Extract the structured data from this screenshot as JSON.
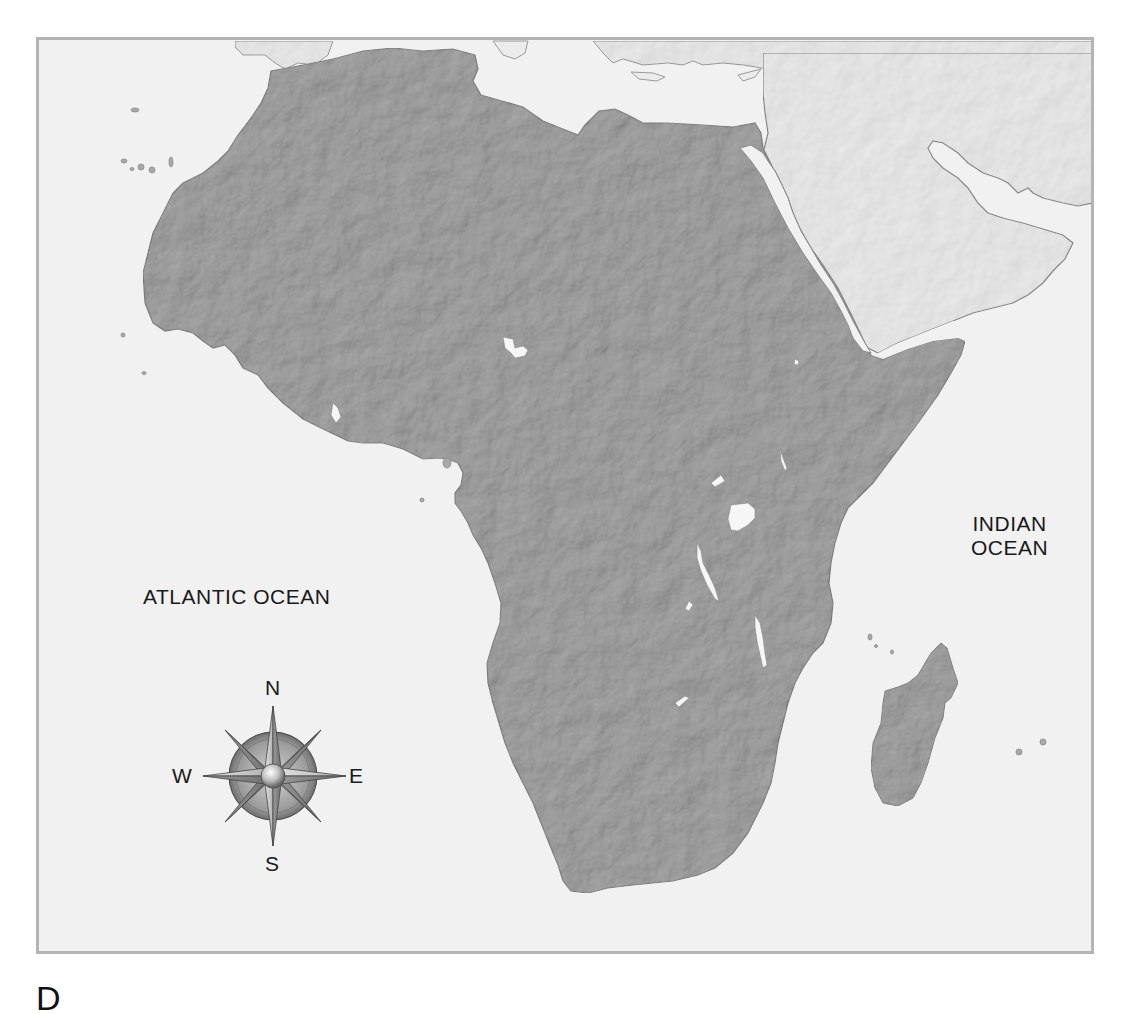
{
  "map": {
    "title": "Physical relief map of Africa",
    "colors": {
      "land_africa": "#a9a9a9",
      "land_other": "#ececec",
      "water": "#f1f1f1",
      "frame_border": "#b4b4b4",
      "lakes": "#f6f6f6",
      "coastline": "#8a8a8a"
    },
    "labels": {
      "atlantic": "ATLANTIC OCEAN",
      "indian_line1": "INDIAN",
      "indian_line2": "OCEAN"
    },
    "features": [
      "Africa",
      "Madagascar",
      "Arabian Peninsula",
      "Mediterranean Sea",
      "Red Sea",
      "Persian Gulf",
      "Lake Chad",
      "Lake Victoria",
      "Lake Tanganyika",
      "Lake Malawi",
      "Canary Islands",
      "Mascarene Islands"
    ]
  },
  "compass": {
    "icon": "compass-rose-icon",
    "north": "N",
    "south": "S",
    "east": "E",
    "west": "W"
  },
  "caption": {
    "text": "D"
  }
}
